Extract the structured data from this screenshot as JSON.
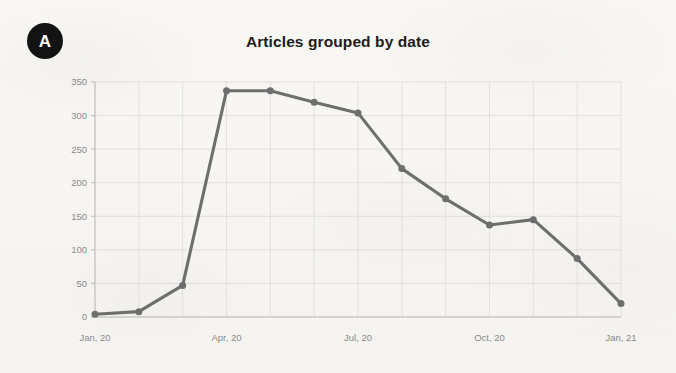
{
  "panel": {
    "label": "A"
  },
  "chart_data": {
    "type": "line",
    "title": "Articles grouped by date",
    "xlabel": "",
    "ylabel": "",
    "grid": true,
    "legend": "none",
    "xlim": [
      "Jan, 20",
      "Jan, 21"
    ],
    "ylim": [
      0,
      350
    ],
    "ytick_labels": [
      "0",
      "50",
      "100",
      "150",
      "200",
      "250",
      "300",
      "350"
    ],
    "ytick_values": [
      0,
      50,
      100,
      150,
      200,
      250,
      300,
      350
    ],
    "xtick_labels": [
      "Jan, 20",
      "Apr, 20",
      "Jul, 20",
      "Oct, 20",
      "Jan, 21"
    ],
    "xtick_indices": [
      0,
      3,
      6,
      9,
      12
    ],
    "categories": [
      "Jan, 20",
      "Feb, 20",
      "Mar, 20",
      "Apr, 20",
      "May, 20",
      "Jun, 20",
      "Jul, 20",
      "Aug, 20",
      "Sep, 20",
      "Oct, 20",
      "Nov, 20",
      "Dec, 20",
      "Jan, 21"
    ],
    "values": [
      4,
      8,
      47,
      337,
      337,
      320,
      304,
      221,
      176,
      137,
      145,
      87,
      20
    ],
    "series": [
      {
        "name": "Articles",
        "color": "#6e6e6e",
        "marker": "circle",
        "values": [
          4,
          8,
          47,
          337,
          337,
          320,
          304,
          221,
          176,
          137,
          145,
          87,
          20
        ]
      }
    ],
    "colors": {
      "line": "#6e6e6e",
      "marker": "#6e6e6e",
      "grid": "#d8d6d2",
      "axis": "#b9b7b3",
      "tick_text": "#8a8a8a",
      "title_text": "#1c1c1c",
      "background": "#f7f6f3",
      "panel_badge": "#131313"
    }
  }
}
